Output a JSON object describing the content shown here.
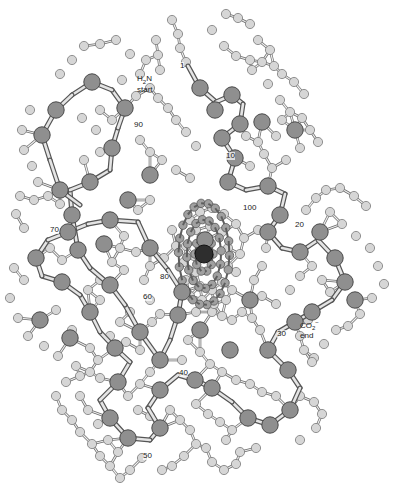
{
  "diagram": {
    "type": "ball-and-stick protein structure",
    "colors": {
      "background": "#ffffff",
      "alpha_carbon": "#8f8f8f",
      "alpha_carbon_stroke": "#4a4a4a",
      "side_atom": "#d6d6d6",
      "side_atom_stroke": "#7a7a7a",
      "bond": "#b8b8b8",
      "bond_stroke": "#6a6a6a",
      "heme_atom": "#a0a0a0",
      "iron": "#2e2e2e"
    },
    "labels": {
      "n_terminus": {
        "formula_main": "H",
        "formula_sub": "2",
        "formula_tail": "N",
        "text": "start",
        "x": 137,
        "y": 75
      },
      "c_terminus": {
        "formula_main": "CO",
        "formula_sub": "2",
        "formula_sup": "−",
        "text": "end",
        "x": 300,
        "y": 318
      },
      "residues": [
        {
          "label": "1",
          "x": 180,
          "y": 62
        },
        {
          "label": "10",
          "x": 226,
          "y": 152
        },
        {
          "label": "20",
          "x": 295,
          "y": 221
        },
        {
          "label": "30",
          "x": 277,
          "y": 330
        },
        {
          "label": "40",
          "x": 179,
          "y": 369
        },
        {
          "label": "50",
          "x": 143,
          "y": 452
        },
        {
          "label": "60",
          "x": 143,
          "y": 293
        },
        {
          "label": "70",
          "x": 50,
          "y": 226
        },
        {
          "label": "80",
          "x": 160,
          "y": 273
        },
        {
          "label": "90",
          "x": 134,
          "y": 121
        },
        {
          "label": "100",
          "x": 243,
          "y": 204
        }
      ]
    },
    "backbone": [
      [
        188,
        66
      ],
      [
        200,
        88
      ],
      [
        216,
        102
      ],
      [
        232,
        95
      ],
      [
        243,
        104
      ],
      [
        240,
        124
      ],
      [
        222,
        138
      ],
      [
        235,
        158
      ],
      [
        228,
        182
      ],
      [
        246,
        190
      ],
      [
        268,
        186
      ],
      [
        285,
        194
      ],
      [
        280,
        215
      ],
      [
        268,
        232
      ],
      [
        282,
        248
      ],
      [
        300,
        252
      ],
      [
        318,
        240
      ],
      [
        335,
        258
      ],
      [
        345,
        282
      ],
      [
        332,
        300
      ],
      [
        312,
        312
      ],
      [
        295,
        322
      ],
      [
        278,
        332
      ],
      [
        268,
        350
      ],
      [
        288,
        370
      ],
      [
        300,
        388
      ],
      [
        290,
        410
      ],
      [
        270,
        425
      ],
      [
        248,
        418
      ],
      [
        232,
        402
      ],
      [
        212,
        388
      ],
      [
        195,
        380
      ],
      [
        178,
        375
      ],
      [
        160,
        390
      ],
      [
        148,
        408
      ],
      [
        160,
        428
      ],
      [
        150,
        440
      ],
      [
        128,
        438
      ],
      [
        110,
        418
      ],
      [
        100,
        400
      ],
      [
        118,
        382
      ],
      [
        130,
        362
      ],
      [
        115,
        348
      ],
      [
        100,
        332
      ],
      [
        90,
        312
      ],
      [
        80,
        295
      ],
      [
        62,
        282
      ],
      [
        42,
        276
      ],
      [
        36,
        258
      ],
      [
        48,
        240
      ],
      [
        68,
        232
      ],
      [
        88,
        224
      ],
      [
        110,
        220
      ],
      [
        138,
        222
      ],
      [
        150,
        248
      ],
      [
        168,
        270
      ],
      [
        182,
        292
      ],
      [
        178,
        315
      ],
      [
        170,
        340
      ],
      [
        160,
        360
      ],
      [
        140,
        332
      ],
      [
        125,
        305
      ],
      [
        110,
        285
      ],
      [
        90,
        268
      ],
      [
        78,
        250
      ],
      [
        72,
        215
      ],
      [
        70,
        190
      ],
      [
        90,
        182
      ],
      [
        110,
        170
      ],
      [
        112,
        148
      ],
      [
        118,
        128
      ],
      [
        125,
        108
      ],
      [
        112,
        90
      ],
      [
        92,
        82
      ],
      [
        72,
        95
      ],
      [
        56,
        110
      ],
      [
        42,
        135
      ],
      [
        50,
        160
      ],
      [
        60,
        190
      ],
      [
        80,
        205
      ]
    ],
    "alpha_carbons": [
      [
        200,
        88
      ],
      [
        232,
        95
      ],
      [
        240,
        124
      ],
      [
        222,
        138
      ],
      [
        235,
        158
      ],
      [
        228,
        182
      ],
      [
        268,
        186
      ],
      [
        280,
        215
      ],
      [
        268,
        232
      ],
      [
        300,
        252
      ],
      [
        335,
        258
      ],
      [
        345,
        282
      ],
      [
        312,
        312
      ],
      [
        295,
        322
      ],
      [
        268,
        350
      ],
      [
        288,
        370
      ],
      [
        290,
        410
      ],
      [
        270,
        425
      ],
      [
        248,
        418
      ],
      [
        212,
        388
      ],
      [
        195,
        380
      ],
      [
        160,
        390
      ],
      [
        160,
        428
      ],
      [
        128,
        438
      ],
      [
        110,
        418
      ],
      [
        118,
        382
      ],
      [
        115,
        348
      ],
      [
        90,
        312
      ],
      [
        62,
        282
      ],
      [
        36,
        258
      ],
      [
        68,
        232
      ],
      [
        110,
        220
      ],
      [
        150,
        248
      ],
      [
        182,
        292
      ],
      [
        178,
        315
      ],
      [
        160,
        360
      ],
      [
        140,
        332
      ],
      [
        110,
        285
      ],
      [
        78,
        250
      ],
      [
        72,
        215
      ],
      [
        90,
        182
      ],
      [
        112,
        148
      ],
      [
        125,
        108
      ],
      [
        92,
        82
      ],
      [
        56,
        110
      ],
      [
        42,
        135
      ],
      [
        60,
        190
      ],
      [
        262,
        122
      ],
      [
        205,
        240
      ],
      [
        320,
        232
      ],
      [
        355,
        300
      ],
      [
        70,
        338
      ],
      [
        40,
        320
      ],
      [
        104,
        244
      ],
      [
        128,
        200
      ],
      [
        250,
        300
      ],
      [
        200,
        330
      ],
      [
        230,
        350
      ],
      [
        215,
        110
      ],
      [
        150,
        175
      ],
      [
        295,
        130
      ]
    ],
    "side_atoms": [
      [
        172,
        20
      ],
      [
        178,
        34
      ],
      [
        180,
        48
      ],
      [
        186,
        62
      ],
      [
        156,
        40
      ],
      [
        158,
        55
      ],
      [
        160,
        70
      ],
      [
        100,
        44
      ],
      [
        116,
        40
      ],
      [
        130,
        54
      ],
      [
        84,
        46
      ],
      [
        72,
        60
      ],
      [
        60,
        74
      ],
      [
        212,
        30
      ],
      [
        224,
        46
      ],
      [
        236,
        56
      ],
      [
        250,
        60
      ],
      [
        262,
        62
      ],
      [
        274,
        66
      ],
      [
        282,
        74
      ],
      [
        294,
        82
      ],
      [
        304,
        94
      ],
      [
        226,
        14
      ],
      [
        238,
        18
      ],
      [
        250,
        24
      ],
      [
        258,
        40
      ],
      [
        270,
        50
      ],
      [
        150,
        88
      ],
      [
        158,
        98
      ],
      [
        168,
        108
      ],
      [
        176,
        120
      ],
      [
        186,
        132
      ],
      [
        196,
        146
      ],
      [
        140,
        140
      ],
      [
        150,
        152
      ],
      [
        162,
        160
      ],
      [
        176,
        170
      ],
      [
        190,
        178
      ],
      [
        252,
        70
      ],
      [
        268,
        84
      ],
      [
        280,
        100
      ],
      [
        290,
        112
      ],
      [
        302,
        118
      ],
      [
        310,
        130
      ],
      [
        318,
        142
      ],
      [
        300,
        148
      ],
      [
        286,
        160
      ],
      [
        272,
        168
      ],
      [
        258,
        142
      ],
      [
        246,
        136
      ],
      [
        30,
        110
      ],
      [
        22,
        130
      ],
      [
        24,
        150
      ],
      [
        32,
        166
      ],
      [
        38,
        182
      ],
      [
        20,
        196
      ],
      [
        16,
        214
      ],
      [
        24,
        228
      ],
      [
        14,
        268
      ],
      [
        24,
        280
      ],
      [
        10,
        298
      ],
      [
        18,
        318
      ],
      [
        28,
        336
      ],
      [
        44,
        346
      ],
      [
        58,
        356
      ],
      [
        76,
        366
      ],
      [
        90,
        372
      ],
      [
        100,
        378
      ],
      [
        330,
        212
      ],
      [
        342,
        224
      ],
      [
        356,
        236
      ],
      [
        370,
        248
      ],
      [
        378,
        266
      ],
      [
        384,
        284
      ],
      [
        372,
        298
      ],
      [
        360,
        314
      ],
      [
        348,
        326
      ],
      [
        336,
        330
      ],
      [
        324,
        344
      ],
      [
        314,
        358
      ],
      [
        308,
        320
      ],
      [
        300,
        336
      ],
      [
        304,
        350
      ],
      [
        312,
        362
      ],
      [
        260,
        330
      ],
      [
        252,
        318
      ],
      [
        242,
        312
      ],
      [
        232,
        320
      ],
      [
        222,
        316
      ],
      [
        212,
        312
      ],
      [
        196,
        312
      ],
      [
        188,
        340
      ],
      [
        182,
        360
      ],
      [
        200,
        352
      ],
      [
        210,
        364
      ],
      [
        222,
        372
      ],
      [
        236,
        380
      ],
      [
        250,
        384
      ],
      [
        262,
        392
      ],
      [
        276,
        396
      ],
      [
        300,
        396
      ],
      [
        314,
        402
      ],
      [
        322,
        414
      ],
      [
        316,
        428
      ],
      [
        300,
        440
      ],
      [
        170,
        410
      ],
      [
        180,
        420
      ],
      [
        190,
        430
      ],
      [
        196,
        444
      ],
      [
        184,
        456
      ],
      [
        172,
        466
      ],
      [
        162,
        470
      ],
      [
        142,
        458
      ],
      [
        130,
        470
      ],
      [
        120,
        478
      ],
      [
        110,
        466
      ],
      [
        100,
        456
      ],
      [
        92,
        444
      ],
      [
        80,
        432
      ],
      [
        72,
        420
      ],
      [
        62,
        410
      ],
      [
        56,
        396
      ],
      [
        66,
        382
      ],
      [
        80,
        376
      ],
      [
        98,
        360
      ],
      [
        90,
        348
      ],
      [
        72,
        330
      ],
      [
        56,
        310
      ],
      [
        100,
        300
      ],
      [
        100,
        280
      ],
      [
        88,
        290
      ],
      [
        62,
        260
      ],
      [
        50,
        248
      ],
      [
        60,
        204
      ],
      [
        48,
        196
      ],
      [
        34,
        200
      ],
      [
        84,
        160
      ],
      [
        100,
        152
      ],
      [
        96,
        130
      ],
      [
        82,
        118
      ],
      [
        100,
        110
      ],
      [
        112,
        120
      ],
      [
        136,
        96
      ],
      [
        122,
        80
      ],
      [
        140,
        74
      ],
      [
        146,
        60
      ],
      [
        190,
        220
      ],
      [
        200,
        212
      ],
      [
        212,
        208
      ],
      [
        224,
        214
      ],
      [
        236,
        224
      ],
      [
        244,
        238
      ],
      [
        240,
        254
      ],
      [
        236,
        272
      ],
      [
        232,
        290
      ],
      [
        226,
        300
      ],
      [
        214,
        304
      ],
      [
        202,
        300
      ],
      [
        190,
        296
      ],
      [
        186,
        280
      ],
      [
        184,
        262
      ],
      [
        186,
        246
      ],
      [
        196,
        230
      ],
      [
        210,
        226
      ],
      [
        222,
        232
      ],
      [
        228,
        248
      ],
      [
        228,
        266
      ],
      [
        222,
        282
      ],
      [
        212,
        290
      ],
      [
        200,
        286
      ],
      [
        196,
        272
      ],
      [
        194,
        256
      ],
      [
        258,
        230
      ],
      [
        266,
        248
      ],
      [
        262,
        266
      ],
      [
        254,
        280
      ],
      [
        262,
        296
      ],
      [
        276,
        304
      ],
      [
        290,
        290
      ],
      [
        300,
        276
      ],
      [
        312,
        266
      ],
      [
        322,
        280
      ],
      [
        330,
        292
      ],
      [
        306,
        210
      ],
      [
        316,
        198
      ],
      [
        326,
        190
      ],
      [
        340,
        188
      ],
      [
        354,
        196
      ],
      [
        366,
        206
      ],
      [
        282,
        120
      ],
      [
        276,
        136
      ],
      [
        264,
        154
      ],
      [
        250,
        166
      ],
      [
        150,
        200
      ],
      [
        138,
        210
      ],
      [
        124,
        236
      ],
      [
        136,
        252
      ],
      [
        124,
        270
      ],
      [
        112,
        262
      ],
      [
        120,
        248
      ],
      [
        172,
        230
      ],
      [
        176,
        246
      ],
      [
        164,
        258
      ],
      [
        150,
        266
      ],
      [
        144,
        280
      ],
      [
        150,
        300
      ],
      [
        160,
        314
      ],
      [
        152,
        322
      ],
      [
        130,
        312
      ],
      [
        120,
        322
      ],
      [
        110,
        336
      ],
      [
        126,
        342
      ],
      [
        140,
        350
      ],
      [
        150,
        372
      ],
      [
        140,
        384
      ],
      [
        128,
        396
      ],
      [
        138,
        410
      ],
      [
        150,
        416
      ],
      [
        118,
        452
      ],
      [
        108,
        440
      ],
      [
        98,
        424
      ],
      [
        88,
        410
      ],
      [
        80,
        396
      ],
      [
        226,
        440
      ],
      [
        240,
        452
      ],
      [
        256,
        448
      ],
      [
        236,
        464
      ],
      [
        224,
        470
      ],
      [
        212,
        462
      ],
      [
        206,
        448
      ],
      [
        196,
        404
      ],
      [
        208,
        414
      ],
      [
        220,
        422
      ],
      [
        232,
        430
      ]
    ],
    "iron": [
      204,
      254
    ]
  }
}
